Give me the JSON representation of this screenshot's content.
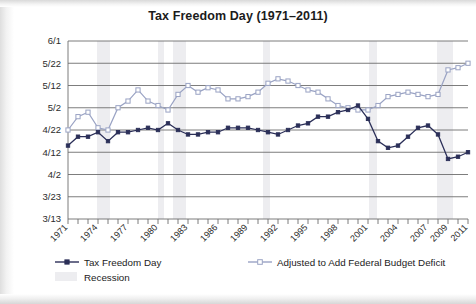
{
  "chart_data": {
    "type": "line",
    "title": "Tax Freedom Day (1971–2011)",
    "xlabel": "",
    "ylabel": "",
    "grid": true,
    "legend_position": "bottom",
    "x": [
      1971,
      1972,
      1973,
      1974,
      1975,
      1976,
      1977,
      1978,
      1979,
      1980,
      1981,
      1982,
      1983,
      1984,
      1985,
      1986,
      1987,
      1988,
      1989,
      1990,
      1991,
      1992,
      1993,
      1994,
      1995,
      1996,
      1997,
      1998,
      1999,
      2000,
      2001,
      2002,
      2003,
      2004,
      2005,
      2006,
      2007,
      2008,
      2009,
      2010,
      2011
    ],
    "xtick_labels": [
      "1971",
      "1974",
      "1977",
      "1980",
      "1983",
      "1986",
      "1989",
      "1992",
      "1995",
      "1998",
      "2001",
      "2004",
      "2007",
      "2009",
      "2011"
    ],
    "ytick_labels": [
      "3/13",
      "3/23",
      "4/2",
      "4/12",
      "4/22",
      "5/2",
      "5/12",
      "5/22",
      "6/1"
    ],
    "ylim": [
      "3/13",
      "6/1"
    ],
    "ylim_days": [
      72,
      152
    ],
    "series": [
      {
        "name": "Tax Freedom Day",
        "color": "#2b2f58",
        "marker": "filled-square",
        "values_label": [
          "4/15",
          "4/18",
          "4/19",
          "4/21",
          "4/17",
          "4/20",
          "4/21",
          "4/22",
          "4/23",
          "4/21",
          "4/25",
          "4/22",
          "4/19",
          "4/19",
          "4/20",
          "4/21",
          "4/23",
          "4/22",
          "4/23",
          "4/22",
          "4/21",
          "4/20",
          "4/22",
          "4/24",
          "4/25",
          "4/27",
          "4/28",
          "4/30",
          "5/1",
          "5/3",
          "4/27",
          "4/17",
          "4/14",
          "4/15",
          "4/19",
          "4/23",
          "4/24",
          "4/20",
          "4/9",
          "4/10",
          "4/12"
        ],
        "values_day_of_year": [
          105,
          109,
          109,
          111,
          107,
          111,
          111,
          112,
          113,
          112,
          115,
          112,
          110,
          110,
          111,
          111,
          113,
          113,
          113,
          112,
          111,
          110,
          112,
          114,
          115,
          118,
          118,
          120,
          121,
          123,
          117,
          107,
          104,
          105,
          109,
          113,
          114,
          110,
          99,
          100,
          102
        ]
      },
      {
        "name": "Adjusted to Add Federal Budget Deficit",
        "color": "#9aa3c4",
        "marker": "open-square",
        "values_label": [
          "4/22",
          "4/28",
          "4/30",
          "4/23",
          "4/22",
          "5/2",
          "5/5",
          "5/10",
          "5/5",
          "5/3",
          "5/1",
          "5/8",
          "5/12",
          "5/9",
          "5/11",
          "5/10",
          "5/6",
          "5/6",
          "5/7",
          "5/9",
          "5/13",
          "5/15",
          "5/14",
          "5/12",
          "5/10",
          "5/9",
          "5/6",
          "5/3",
          "5/2",
          "5/1",
          "5/1",
          "5/3",
          "5/7",
          "5/8",
          "5/9",
          "5/8",
          "5/7",
          "5/8",
          "5/19",
          "5/20",
          "5/22"
        ],
        "values_day_of_year": [
          112,
          118,
          120,
          113,
          112,
          122,
          125,
          130,
          125,
          123,
          121,
          128,
          132,
          129,
          131,
          130,
          126,
          126,
          127,
          129,
          133,
          135,
          134,
          132,
          130,
          129,
          126,
          123,
          122,
          121,
          121,
          123,
          127,
          128,
          129,
          128,
          127,
          128,
          139,
          140,
          142
        ]
      }
    ],
    "shaded_regions": {
      "name": "Recession",
      "color": "#ededf0",
      "bands": [
        [
          1973.9,
          1975.2
        ],
        [
          1980.0,
          1980.6
        ],
        [
          1981.5,
          1982.8
        ],
        [
          1990.5,
          1991.2
        ],
        [
          2001.1,
          2001.9
        ],
        [
          2007.9,
          2009.5
        ]
      ]
    }
  },
  "legend": {
    "items": [
      {
        "label": "Tax Freedom Day",
        "type": "line-filled-marker",
        "color": "#2b2f58"
      },
      {
        "label": "Recession",
        "type": "swatch",
        "color": "#ededf0"
      },
      {
        "label": "Adjusted to Add Federal Budget Deficit",
        "type": "line-open-marker",
        "color": "#9aa3c4"
      }
    ]
  }
}
